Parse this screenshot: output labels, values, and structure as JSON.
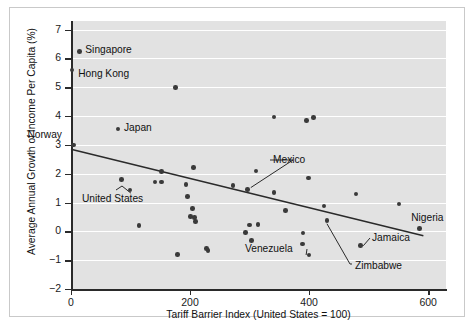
{
  "chart_data": {
    "type": "scatter",
    "title": "",
    "xlabel": "Tariff Barrier Index (United States = 100)",
    "ylabel": "Average Annual Growth of Income Per Capita (%)",
    "xlim": [
      0,
      630
    ],
    "ylim": [
      -2,
      7.3
    ],
    "xticks": [
      0,
      200,
      400,
      600
    ],
    "xtick_labels": [
      "0",
      "200",
      "400",
      "600"
    ],
    "yticks": [
      -2,
      -1,
      0,
      1,
      2,
      3,
      4,
      5,
      6,
      7
    ],
    "ytick_labels": [
      "−2",
      "−1",
      "0",
      "1",
      "2",
      "3",
      "4",
      "5",
      "6",
      "7"
    ],
    "grid": "horizontal",
    "plot_background": "#e2e2e2",
    "point_color": "#3a3a3a",
    "trendline": {
      "color": "#2a2a2a",
      "x_start": 0,
      "y_start": 2.85,
      "x_end": 592,
      "y_end": -0.15
    },
    "points": [
      {
        "x": 14,
        "y": 6.25,
        "label": "Singapore"
      },
      {
        "x": 2,
        "y": 5.6,
        "label": "Hong Kong"
      },
      {
        "x": 176,
        "y": 5.0,
        "label": ""
      },
      {
        "x": 341,
        "y": 3.97,
        "label": ""
      },
      {
        "x": 396,
        "y": 3.85,
        "label": ""
      },
      {
        "x": 407,
        "y": 3.95,
        "label": ""
      },
      {
        "x": 79,
        "y": 3.55,
        "label": "Japan"
      },
      {
        "x": 4,
        "y": 3.0,
        "label": "Norway"
      },
      {
        "x": 206,
        "y": 2.22,
        "label": ""
      },
      {
        "x": 152,
        "y": 2.08,
        "label": ""
      },
      {
        "x": 311,
        "y": 2.1,
        "label": ""
      },
      {
        "x": 399,
        "y": 1.85,
        "label": ""
      },
      {
        "x": 85,
        "y": 1.8,
        "label": ""
      },
      {
        "x": 141,
        "y": 1.72,
        "label": ""
      },
      {
        "x": 152,
        "y": 1.71,
        "label": ""
      },
      {
        "x": 193,
        "y": 1.62,
        "label": ""
      },
      {
        "x": 272,
        "y": 1.6,
        "label": ""
      },
      {
        "x": 297,
        "y": 1.45,
        "label": "Mexico"
      },
      {
        "x": 99,
        "y": 1.43,
        "label": "United States"
      },
      {
        "x": 341,
        "y": 1.35,
        "label": ""
      },
      {
        "x": 479,
        "y": 1.3,
        "label": ""
      },
      {
        "x": 196,
        "y": 1.21,
        "label": ""
      },
      {
        "x": 551,
        "y": 0.95,
        "label": ""
      },
      {
        "x": 425,
        "y": 0.88,
        "label": ""
      },
      {
        "x": 204,
        "y": 0.8,
        "label": ""
      },
      {
        "x": 360,
        "y": 0.72,
        "label": ""
      },
      {
        "x": 201,
        "y": 0.52,
        "label": ""
      },
      {
        "x": 207,
        "y": 0.48,
        "label": ""
      },
      {
        "x": 209,
        "y": 0.35,
        "label": ""
      },
      {
        "x": 430,
        "y": 0.37,
        "label": "Zimbabwe"
      },
      {
        "x": 300,
        "y": 0.22,
        "label": ""
      },
      {
        "x": 314,
        "y": 0.23,
        "label": ""
      },
      {
        "x": 114,
        "y": 0.2,
        "label": ""
      },
      {
        "x": 585,
        "y": 0.1,
        "label": "Nigeria"
      },
      {
        "x": 293,
        "y": -0.03,
        "label": ""
      },
      {
        "x": 390,
        "y": -0.05,
        "label": ""
      },
      {
        "x": 303,
        "y": -0.32,
        "label": ""
      },
      {
        "x": 389,
        "y": -0.44,
        "label": ""
      },
      {
        "x": 486,
        "y": -0.5,
        "label": "Jamaica"
      },
      {
        "x": 228,
        "y": -0.6,
        "label": ""
      },
      {
        "x": 230,
        "y": -0.67,
        "label": ""
      },
      {
        "x": 179,
        "y": -0.8,
        "label": ""
      },
      {
        "x": 400,
        "y": -0.82,
        "label": "Venezuela"
      }
    ],
    "annotations": [
      {
        "name": "singapore",
        "text": "Singapore",
        "anchor": "right-of-point"
      },
      {
        "name": "hong-kong",
        "text": "Hong Kong",
        "anchor": "right-of-point"
      },
      {
        "name": "japan",
        "text": "Japan",
        "anchor": "right-of-point"
      },
      {
        "name": "norway",
        "text": "Norway",
        "anchor": "above-point"
      },
      {
        "name": "mexico",
        "text": "Mexico",
        "anchor": "leader-line"
      },
      {
        "name": "united-states",
        "text": "United States",
        "anchor": "leader-line"
      },
      {
        "name": "venezuela",
        "text": "Venezuela",
        "anchor": "leader-line"
      },
      {
        "name": "zimbabwe",
        "text": "Zimbabwe",
        "anchor": "leader-line"
      },
      {
        "name": "jamaica",
        "text": "Jamaica",
        "anchor": "leader-line"
      },
      {
        "name": "nigeria",
        "text": "Nigeria",
        "anchor": "above-point"
      }
    ]
  }
}
